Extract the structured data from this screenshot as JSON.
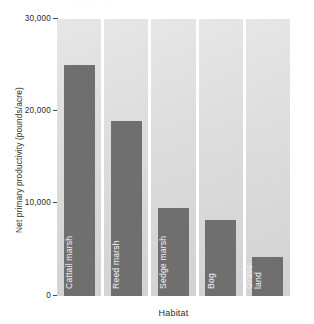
{
  "chart_data": {
    "type": "bar",
    "title": "",
    "xlabel": "Habitat",
    "ylabel": "Net primary productivity (pounds/acre)",
    "categories": [
      "Cattail marsh",
      "Reed marsh",
      "Sedge marsh",
      "Bog",
      "Grass-land"
    ],
    "values": [
      25000,
      19000,
      9500,
      8200,
      4200
    ],
    "ylim": [
      0,
      30000
    ],
    "yticks": [
      "0",
      "10,000",
      "20,000",
      "30,000"
    ],
    "ytick_values": [
      0,
      10000,
      20000,
      30000
    ],
    "grid": false,
    "legend": null,
    "bars": [
      {
        "label": "Cattail marsh",
        "value": 25000,
        "label_lines": [
          "Cattail marsh"
        ]
      },
      {
        "label": "Reed marsh",
        "value": 19000,
        "label_lines": [
          "Reed marsh"
        ]
      },
      {
        "label": "Sedge marsh",
        "value": 9500,
        "label_lines": [
          "Sedge marsh"
        ]
      },
      {
        "label": "Bog",
        "value": 8200,
        "label_lines": [
          "Bog"
        ]
      },
      {
        "label": "Grass-land",
        "value": 4200,
        "label_lines": [
          "Grass-",
          "land"
        ]
      }
    ],
    "colors": {
      "bar": "#6f6f6f",
      "panel": "#dcdcdc",
      "text": "#2b2b2b",
      "bar_label_text": "#f2f2f2",
      "background": "#ffffff"
    }
  },
  "artifact": {
    "top_smudge": "· · · ·"
  }
}
